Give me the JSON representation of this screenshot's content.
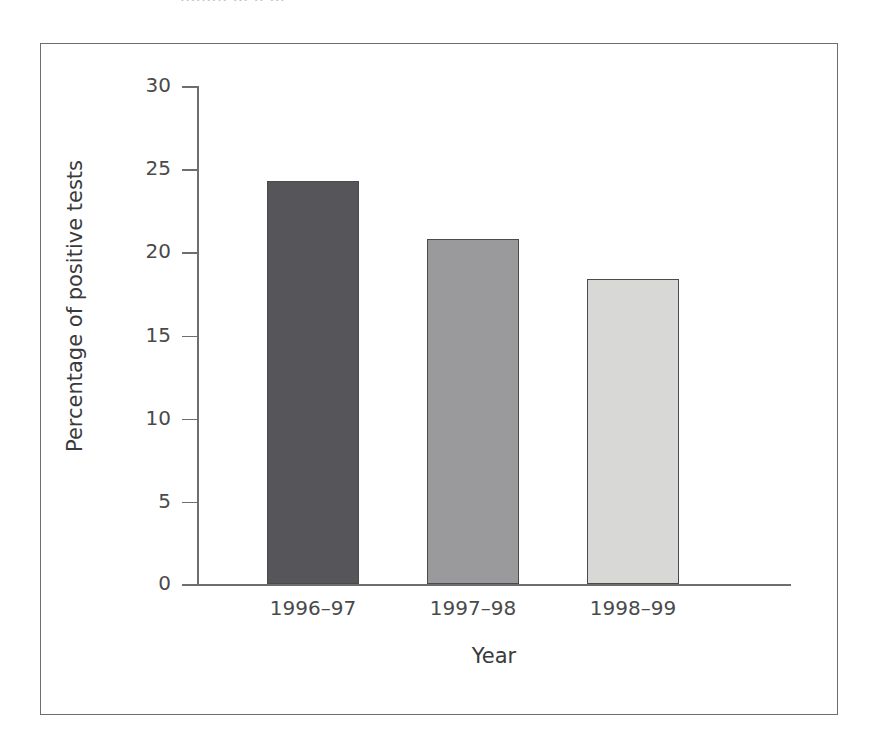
{
  "figure": {
    "top_cut_text": "......... ... .. ..."
  },
  "chart_data": {
    "type": "bar",
    "title": "",
    "categories": [
      "1996–97",
      "1997–98",
      "1998–99"
    ],
    "values": [
      24.3,
      20.8,
      18.4
    ],
    "xlabel": "Year",
    "ylabel": "Percentage of positive tests",
    "ylim": [
      0,
      30
    ],
    "yticks": [
      0,
      5,
      10,
      15,
      20,
      25,
      30
    ],
    "ytick_labels": [
      "0",
      "5",
      "10",
      "15",
      "20",
      "25",
      "30"
    ],
    "grid": false,
    "legend": "none",
    "bar_colors": [
      "#56565a",
      "#9a9a9c",
      "#d8d8d6"
    ],
    "bar_edge_color": "#4a4a4a",
    "axis_color": "#6e6e6e",
    "frame_color": "#6e6e6e",
    "background": "#ffffff"
  }
}
